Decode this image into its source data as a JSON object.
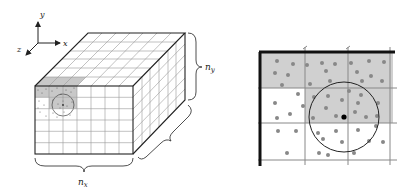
{
  "figure": {
    "left_panel": {
      "title": "3D spatial grid with particle cell lists",
      "axes": {
        "x": "x",
        "y": "y",
        "z": "z"
      },
      "dimension_labels": {
        "nx": {
          "base": "n",
          "sub": "x"
        },
        "ny": {
          "base": "n",
          "sub": "y"
        }
      },
      "grid": {
        "front_columns": 7,
        "front_rows": 6,
        "depth_cells": 6
      }
    },
    "right_panel": {
      "title": "Zoomed cell neighborhood with cutoff circle",
      "grid": {
        "columns": 3,
        "rows": 3
      },
      "shaded_cells": [
        [
          0,
          0
        ],
        [
          0,
          1
        ],
        [
          0,
          2
        ],
        [
          1,
          1
        ],
        [
          1,
          2
        ]
      ]
    },
    "colors": {
      "line": "#222222",
      "grid": "#888888",
      "shade": "#d0d0d0",
      "particle": "#888888",
      "center_particle": "#000000"
    }
  }
}
